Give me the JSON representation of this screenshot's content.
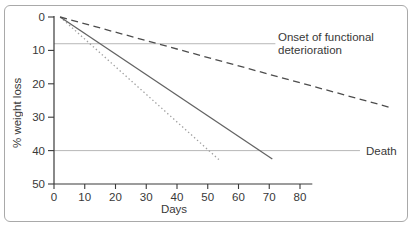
{
  "chart_data": {
    "type": "line",
    "title": "",
    "xlabel": "Days",
    "ylabel": "% weight loss",
    "xlim": [
      0,
      84
    ],
    "ylim": [
      0,
      50
    ],
    "y_inverted": true,
    "grid": false,
    "x_ticks": [
      0,
      10,
      20,
      30,
      40,
      50,
      60,
      70,
      80
    ],
    "y_ticks": [
      0,
      10,
      20,
      30,
      40,
      50
    ],
    "axis_color": "#3a3a3a",
    "tick_label_color": "#383838",
    "series": [
      {
        "name": "rapid-weight-loss",
        "style": "dotted",
        "color": "#a0a0a0",
        "points": [
          [
            2,
            0
          ],
          [
            54,
            43
          ]
        ]
      },
      {
        "name": "intermediate-weight-loss",
        "style": "solid",
        "color": "#636363",
        "points": [
          [
            2,
            0
          ],
          [
            71,
            42.5
          ]
        ]
      },
      {
        "name": "slow-weight-loss",
        "style": "dashed",
        "color": "#4d4d4d",
        "points": [
          [
            2,
            0
          ],
          [
            109,
            27
          ]
        ]
      }
    ],
    "reference_lines": [
      {
        "label": "Onset of functional deterioration",
        "value": 8,
        "x_start": 0,
        "x_end": 72,
        "color": "#b8b8b8"
      },
      {
        "label": "Death",
        "value": 40,
        "x_start": 0,
        "x_end": 99.5,
        "color": "#b8b8b8"
      }
    ],
    "legend": "none",
    "annotation_position": "right-of-line"
  }
}
